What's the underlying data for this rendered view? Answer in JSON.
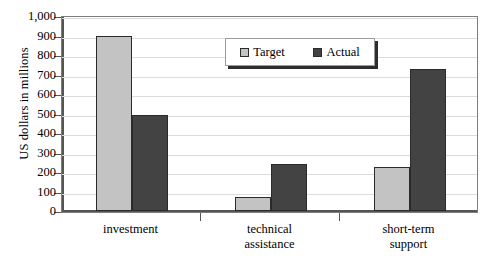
{
  "chart_data": {
    "type": "bar",
    "title": "",
    "xlabel": "",
    "ylabel": "US dollars in millions",
    "categories": [
      "investment",
      "technical\nassistance",
      "short-term\nsupport"
    ],
    "series": [
      {
        "name": "Target",
        "color": "#c3c3c3",
        "values": [
          900,
          70,
          225
        ]
      },
      {
        "name": "Actual",
        "color": "#434343",
        "values": [
          490,
          240,
          730
        ]
      }
    ],
    "ylim": [
      0,
      1000
    ],
    "ytick_step": 100,
    "ytick_labels": [
      "0",
      "100",
      "200",
      "300",
      "400",
      "500",
      "600",
      "700",
      "800",
      "900",
      "1,000"
    ],
    "grid": true,
    "legend_position": "inside-top-center"
  }
}
